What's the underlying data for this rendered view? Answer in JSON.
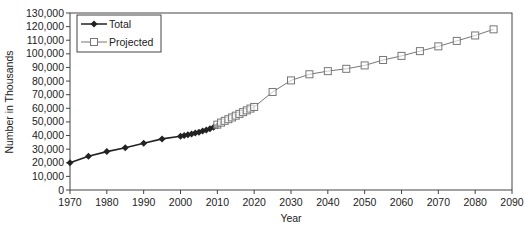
{
  "chart_data": {
    "type": "line",
    "title": "",
    "xlabel": "Year",
    "ylabel": "Number in Thousands",
    "xlim": [
      1970,
      2090
    ],
    "ylim": [
      0,
      130000
    ],
    "x_ticks": [
      1970,
      1980,
      1990,
      2000,
      2010,
      2020,
      2030,
      2040,
      2050,
      2060,
      2070,
      2080,
      2090
    ],
    "y_ticks": [
      0,
      10000,
      20000,
      30000,
      40000,
      50000,
      60000,
      70000,
      80000,
      90000,
      100000,
      110000,
      120000,
      130000
    ],
    "y_tick_labels": [
      "0",
      "10,000",
      "20,000",
      "30,000",
      "40,000",
      "50,000",
      "60,000",
      "70,000",
      "80,000",
      "90,000",
      "100,000",
      "110,000",
      "120,000",
      "130,000"
    ],
    "grid": false,
    "legend_position": "upper left",
    "series": [
      {
        "name": "Total",
        "marker": "diamond",
        "color": "#222222",
        "points": [
          [
            1970,
            20000
          ],
          [
            1975,
            24800
          ],
          [
            1980,
            28200
          ],
          [
            1985,
            31100
          ],
          [
            1990,
            34300
          ],
          [
            1995,
            37500
          ],
          [
            2000,
            39500
          ],
          [
            2001,
            40000
          ],
          [
            2002,
            40500
          ],
          [
            2003,
            41100
          ],
          [
            2004,
            41800
          ],
          [
            2005,
            42500
          ],
          [
            2006,
            43300
          ],
          [
            2007,
            44100
          ],
          [
            2008,
            45000
          ],
          [
            2009,
            46000
          ],
          [
            2010,
            47200
          ]
        ]
      },
      {
        "name": "Projected",
        "marker": "square",
        "color": "#777777",
        "points": [
          [
            2010,
            48000
          ],
          [
            2011,
            49500
          ],
          [
            2012,
            50800
          ],
          [
            2013,
            52000
          ],
          [
            2014,
            53300
          ],
          [
            2015,
            54600
          ],
          [
            2016,
            55900
          ],
          [
            2017,
            57200
          ],
          [
            2018,
            58500
          ],
          [
            2019,
            59800
          ],
          [
            2020,
            61000
          ],
          [
            2025,
            72000
          ],
          [
            2030,
            80500
          ],
          [
            2035,
            85000
          ],
          [
            2040,
            87300
          ],
          [
            2045,
            89000
          ],
          [
            2050,
            91500
          ],
          [
            2055,
            95500
          ],
          [
            2060,
            98500
          ],
          [
            2065,
            102000
          ],
          [
            2070,
            105500
          ],
          [
            2075,
            109500
          ],
          [
            2080,
            113500
          ],
          [
            2085,
            118000
          ]
        ]
      }
    ]
  }
}
